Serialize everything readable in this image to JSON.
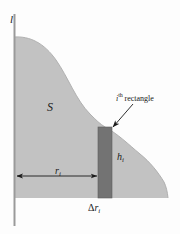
{
  "figure": {
    "type": "diagram",
    "colors": {
      "region_fill": "#c2c2c2",
      "rectangle_fill": "#737373",
      "axis": "#9a9a9a",
      "ink": "#1a1a1a",
      "background": "#fdfdfd"
    },
    "labels": {
      "vertical_axis": "l",
      "region": "S",
      "rectangle_callout_prefix": "i",
      "rectangle_callout_superscript": "th",
      "rectangle_callout_suffix": "rectangle",
      "height": "h",
      "height_sub": "i",
      "radius": "r",
      "radius_sub": "i",
      "width_delta": "Δ",
      "width_symbol": "r",
      "width_sub": "i"
    },
    "geometry": {
      "axis_x": 14,
      "axis_top_y": 14,
      "axis_bottom_y": 226,
      "baseline_y": 198,
      "region_left_top_y": 37,
      "region_right_x": 168,
      "rect_left_x": 98,
      "rect_right_x": 112,
      "rect_top_y": 127,
      "dim_arrow_y": 176,
      "dim_arrow_from_x": 16,
      "dim_arrow_to_x": 98
    }
  }
}
